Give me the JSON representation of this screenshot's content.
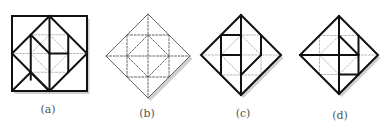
{
  "figure": {
    "panels": [
      {
        "id": "a",
        "label": "(a)",
        "cx": 49.5,
        "cy": 53.5,
        "r": 37.5,
        "frame": "square",
        "solid": [
          [
            -0.5,
            -0.5,
            -0.5,
            0.7
          ],
          [
            -0.5,
            -0.5,
            0,
            0
          ],
          [
            0,
            -1,
            0,
            1
          ],
          [
            0,
            0,
            0.5,
            0
          ],
          [
            0.5,
            -0.5,
            0.5,
            0.5
          ],
          [
            -1,
            1,
            -0.5,
            0.5
          ],
          [
            0,
            1,
            -0.5,
            0.5
          ]
        ],
        "label_x": 48,
        "label_y": 110
      },
      {
        "id": "b",
        "label": "(b)",
        "cx": 148,
        "cy": 56,
        "r": 42,
        "frame": "diamond-shadow",
        "solid": [],
        "label_x": 147,
        "label_y": 114
      },
      {
        "id": "c",
        "label": "(c)",
        "cx": 241,
        "cy": 55,
        "r": 40,
        "frame": "diamond",
        "solid": [
          [
            0,
            -1,
            0,
            1
          ],
          [
            -0.5,
            -0.5,
            -0.5,
            0.5
          ],
          [
            -0.5,
            -0.5,
            0,
            -0.5
          ],
          [
            -0.5,
            0,
            0,
            0
          ],
          [
            0.5,
            -0.5,
            0.5,
            0
          ],
          [
            0.5,
            0,
            0,
            0.5
          ]
        ],
        "label_x": 243,
        "label_y": 114
      },
      {
        "id": "d",
        "label": "(d)",
        "cx": 339,
        "cy": 55,
        "r": 39,
        "frame": "diamond",
        "solid": [
          [
            0,
            -1,
            0,
            1
          ],
          [
            -1,
            0,
            0.5,
            0
          ],
          [
            0,
            -0.5,
            0.5,
            0
          ],
          [
            0.5,
            -0.5,
            0.5,
            0.5
          ],
          [
            0,
            0.5,
            0.5,
            0.5
          ]
        ],
        "label_x": 340,
        "label_y": 116
      }
    ],
    "dashed_grid": [
      [
        -0.5,
        -0.5,
        0.5,
        -0.5
      ],
      [
        0.5,
        -0.5,
        0.5,
        0.5
      ],
      [
        0.5,
        0.5,
        -0.5,
        0.5
      ],
      [
        -0.5,
        0.5,
        -0.5,
        -0.5
      ],
      [
        0,
        -0.5,
        0.5,
        0
      ],
      [
        0.5,
        0,
        0,
        0.5
      ],
      [
        0,
        0.5,
        -0.5,
        0
      ],
      [
        -0.5,
        0,
        0,
        -0.5
      ],
      [
        0,
        -1,
        0,
        1
      ],
      [
        -1,
        0,
        1,
        0
      ]
    ],
    "colors": {
      "line": "#111111",
      "dash": "#9a9a9a",
      "dash_b": "#555555",
      "label": "#555555"
    }
  }
}
